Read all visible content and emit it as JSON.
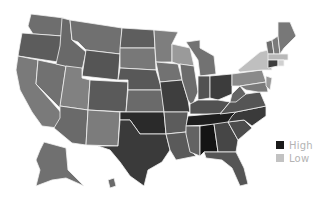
{
  "map": {
    "title": "",
    "type": "choropleth",
    "region": "United States",
    "color_scale": {
      "high": "#1a1a1a",
      "low": "#c8c8c8"
    },
    "states": [
      {
        "id": "WA",
        "fill": "#6e6e6e",
        "points": "31,14 64,18 62,36 33,34 28,26"
      },
      {
        "id": "OR",
        "fill": "#5c5c5c",
        "points": "22,33 62,36 58,62 18,56 20,44"
      },
      {
        "id": "CA",
        "fill": "#7a7a7a",
        "points": "18,56 38,60 36,84 64,116 58,128 42,126 32,112 20,90 16,70"
      },
      {
        "id": "NV",
        "fill": "#717171",
        "points": "38,60 66,66 60,108 36,84"
      },
      {
        "id": "ID",
        "fill": "#696969",
        "points": "62,18 70,20 72,40 86,52 82,70 56,64 60,46"
      },
      {
        "id": "MT",
        "fill": "#707070",
        "points": "70,20 122,28 120,54 86,50 78,42 72,40"
      },
      {
        "id": "WY",
        "fill": "#555555",
        "points": "86,50 120,54 118,80 82,76"
      },
      {
        "id": "UT",
        "fill": "#818181",
        "points": "66,66 82,68 82,78 90,80 88,110 60,106"
      },
      {
        "id": "AZ",
        "fill": "#6a6a6a",
        "points": "60,106 88,110 86,145 72,143 54,128 60,118"
      },
      {
        "id": "CO",
        "fill": "#5a5a5a",
        "points": "90,80 128,82 126,112 88,110"
      },
      {
        "id": "NM",
        "fill": "#7c7c7c",
        "points": "88,110 120,112 118,146 86,145"
      },
      {
        "id": "ND",
        "fill": "#5e5e5e",
        "points": "122,28 154,30 155,48 120,48"
      },
      {
        "id": "SD",
        "fill": "#787878",
        "points": "120,48 155,48 156,70 120,68"
      },
      {
        "id": "NE",
        "fill": "#585858",
        "points": "120,68 156,70 162,90 128,90 128,80 118,80"
      },
      {
        "id": "KS",
        "fill": "#6a6a6a",
        "points": "128,90 162,90 164,112 126,112"
      },
      {
        "id": "OK",
        "fill": "#2a2a2a",
        "points": "120,112 164,112 166,134 140,134 130,120 120,120"
      },
      {
        "id": "TX",
        "fill": "#3a3a3a",
        "points": "120,120 130,120 140,134 166,134 170,150 162,162 148,170 144,186 130,176 120,162 110,150 98,146 118,146"
      },
      {
        "id": "MN",
        "fill": "#7e7e7e",
        "points": "154,30 178,32 172,44 172,62 156,62 155,48"
      },
      {
        "id": "IA",
        "fill": "#727272",
        "points": "156,62 178,64 182,80 160,82"
      },
      {
        "id": "MO",
        "fill": "#3e3e3e",
        "points": "160,82 182,80 188,100 190,112 164,112"
      },
      {
        "id": "AR",
        "fill": "#5c5c5c",
        "points": "164,112 188,112 186,132 166,134"
      },
      {
        "id": "LA",
        "fill": "#5a5a5a",
        "points": "166,134 186,132 190,150 196,156 176,160 170,150"
      },
      {
        "id": "WI",
        "fill": "#9a9a9a",
        "points": "172,44 190,48 194,66 178,64 172,62"
      },
      {
        "id": "IL",
        "fill": "#6c6c6c",
        "points": "180,64 194,66 198,92 192,106 188,100 182,80"
      },
      {
        "id": "MI",
        "fill": "#727272",
        "points": "200,48 214,56 216,74 200,76 198,60 186,42 200,40"
      },
      {
        "id": "IN",
        "fill": "#525252",
        "points": "198,76 210,76 210,98 198,100"
      },
      {
        "id": "OH",
        "fill": "#3c3c3c",
        "points": "210,76 232,74 232,94 218,100 210,98"
      },
      {
        "id": "KY",
        "fill": "#525252",
        "points": "190,104 198,100 218,100 230,102 220,114 190,114"
      },
      {
        "id": "TN",
        "fill": "#1e1e1e",
        "points": "188,116 236,112 232,124 186,126"
      },
      {
        "id": "MS",
        "fill": "#636363",
        "points": "186,126 200,126 200,156 190,152 186,134"
      },
      {
        "id": "AL",
        "fill": "#141414",
        "points": "200,126 214,124 218,152 204,152 200,156"
      },
      {
        "id": "GA",
        "fill": "#464646",
        "points": "214,124 228,122 238,140 236,152 218,152"
      },
      {
        "id": "FL",
        "fill": "#555555",
        "points": "204,152 236,152 244,168 248,184 240,186 232,168 222,160 206,158"
      },
      {
        "id": "SC",
        "fill": "#4c4c4c",
        "points": "228,122 244,120 252,128 238,140"
      },
      {
        "id": "NC",
        "fill": "#3a3a3a",
        "points": "236,112 266,106 266,116 252,126 244,120 228,122 232,116"
      },
      {
        "id": "VA",
        "fill": "#555555",
        "points": "230,102 246,94 260,92 266,106 236,112 220,114"
      },
      {
        "id": "WV",
        "fill": "#646464",
        "points": "232,94 240,86 246,94 236,102 230,102"
      },
      {
        "id": "PA",
        "fill": "#8a8a8a",
        "points": "232,74 262,70 266,82 240,86 232,86"
      },
      {
        "id": "NY",
        "fill": "#bfbfbf",
        "points": "238,70 260,52 268,50 272,70 262,70 240,72"
      },
      {
        "id": "MD",
        "fill": "#7a7a7a",
        "points": "240,86 266,82 268,92 258,92 246,90"
      },
      {
        "id": "NJ",
        "fill": "#9a9a9a",
        "points": "266,76 272,78 270,90 266,86"
      },
      {
        "id": "VT",
        "fill": "#6e6e6e",
        "points": "266,42 272,40 274,54 268,54"
      },
      {
        "id": "NH",
        "fill": "#7a7a7a",
        "points": "272,40 278,36 280,54 274,54"
      },
      {
        "id": "ME",
        "fill": "#787878",
        "points": "278,22 290,22 296,36 284,48 280,54 278,36"
      },
      {
        "id": "MA",
        "fill": "#b8b8b8",
        "points": "268,54 288,54 288,60 268,60"
      },
      {
        "id": "CT",
        "fill": "#3e3e3e",
        "points": "268,60 278,60 278,66 268,68"
      },
      {
        "id": "RI",
        "fill": "#d0d0d0",
        "points": "278,60 284,60 284,66 278,66"
      },
      {
        "id": "AK",
        "fill": "#707070",
        "points": "44,142 66,148 68,170 84,186 66,178 52,180 36,186 40,170 36,160 40,150"
      },
      {
        "id": "HI",
        "fill": "#6a6a6a",
        "points": "108,180 114,178 116,186 110,188"
      }
    ]
  },
  "legend": {
    "items": [
      {
        "label": "High",
        "color": "#1a1a1a"
      },
      {
        "label": "Low",
        "color": "#c2c2c2"
      }
    ]
  }
}
